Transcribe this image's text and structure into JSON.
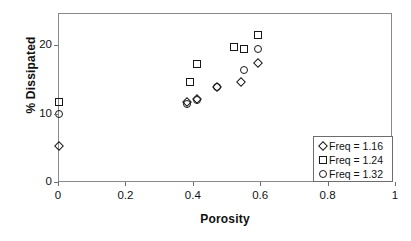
{
  "chart_data": {
    "type": "scatter",
    "title": "",
    "xlabel": "Porosity",
    "ylabel": "% Dissipated",
    "xlim": [
      0,
      1
    ],
    "ylim": [
      0,
      25
    ],
    "xticks": [
      "0",
      "0.2",
      "0.4",
      "0.6",
      "0.8",
      "1"
    ],
    "xtick_values": [
      0,
      0.2,
      0.4,
      0.6,
      0.8,
      1
    ],
    "yticks": [
      "0",
      "10",
      "20"
    ],
    "ytick_values": [
      0,
      10,
      20
    ],
    "grid": false,
    "legend_position": "lower-right",
    "series": [
      {
        "name": "Freq = 1.16",
        "marker": "diamond",
        "points": [
          {
            "x": 0.0,
            "y": 5.4
          },
          {
            "x": 0.38,
            "y": 11.8
          },
          {
            "x": 0.41,
            "y": 12.2
          },
          {
            "x": 0.47,
            "y": 14.0
          },
          {
            "x": 0.54,
            "y": 14.7
          },
          {
            "x": 0.59,
            "y": 17.5
          }
        ]
      },
      {
        "name": "Freq = 1.24",
        "marker": "square",
        "points": [
          {
            "x": 0.0,
            "y": 11.8
          },
          {
            "x": 0.39,
            "y": 14.7
          },
          {
            "x": 0.41,
            "y": 17.3
          },
          {
            "x": 0.52,
            "y": 19.9
          },
          {
            "x": 0.55,
            "y": 19.5
          },
          {
            "x": 0.59,
            "y": 21.6
          }
        ]
      },
      {
        "name": "Freq = 1.32",
        "marker": "circle",
        "points": [
          {
            "x": 0.0,
            "y": 10.1
          },
          {
            "x": 0.38,
            "y": 11.5
          },
          {
            "x": 0.41,
            "y": 12.1
          },
          {
            "x": 0.47,
            "y": 14.0
          },
          {
            "x": 0.55,
            "y": 16.5
          },
          {
            "x": 0.59,
            "y": 19.6
          }
        ]
      }
    ],
    "colors": {
      "marker_stroke": "#171717",
      "frame": "#8a8a8a",
      "text": "#111111",
      "background": "#ffffff"
    }
  }
}
